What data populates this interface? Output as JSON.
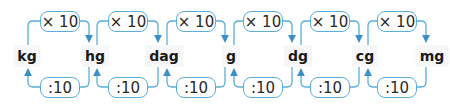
{
  "diagram": {
    "type": "unit-conversion-chain",
    "units": [
      "kg",
      "hg",
      "dag",
      "g",
      "dg",
      "cg",
      "mg"
    ],
    "forward_label": "× 10",
    "backward_label": ":10",
    "colors": {
      "line": "#5aaed8",
      "arrow": "#3a8fc8",
      "text": "#1a1a1a"
    }
  }
}
